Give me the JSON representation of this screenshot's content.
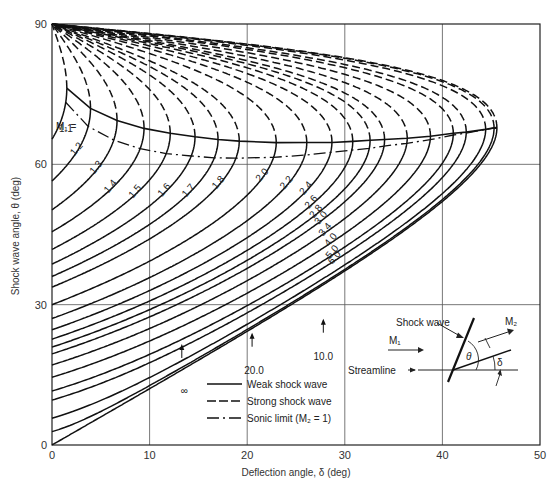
{
  "chart_data": {
    "type": "line",
    "title": "",
    "xlabel": "Deflection angle, δ (deg)",
    "ylabel": "Shock wave angle, θ (deg)",
    "xlim": [
      0,
      50
    ],
    "ylim": [
      0,
      90
    ],
    "x_ticks": [
      "0",
      "10",
      "20",
      "30",
      "40",
      "50"
    ],
    "y_ticks": [
      "0",
      "30",
      "60",
      "90"
    ],
    "grid": true,
    "gamma": 1.4,
    "mach_label_prefix": "M₁ =",
    "series": [
      {
        "name": "1.1",
        "mach": 1.1
      },
      {
        "name": "1.2",
        "mach": 1.2
      },
      {
        "name": "1.3",
        "mach": 1.3
      },
      {
        "name": "1.4",
        "mach": 1.4
      },
      {
        "name": "1.5",
        "mach": 1.5
      },
      {
        "name": "1.6",
        "mach": 1.6
      },
      {
        "name": "1.7",
        "mach": 1.7
      },
      {
        "name": "1.8",
        "mach": 1.8
      },
      {
        "name": "2.0",
        "mach": 2.0
      },
      {
        "name": "2.2",
        "mach": 2.2
      },
      {
        "name": "2.4",
        "mach": 2.4
      },
      {
        "name": "2.6",
        "mach": 2.6
      },
      {
        "name": "2.8",
        "mach": 2.8
      },
      {
        "name": "3.0",
        "mach": 3.0
      },
      {
        "name": "3.4",
        "mach": 3.4
      },
      {
        "name": "4.0",
        "mach": 4.0
      },
      {
        "name": "5.0",
        "mach": 5.0
      },
      {
        "name": "6.0",
        "mach": 6.0
      },
      {
        "name": "10.0",
        "mach": 10.0
      },
      {
        "name": "20.0",
        "mach": 20.0
      },
      {
        "name": "∞",
        "mach": 1000
      }
    ],
    "max_deflection_example": {
      "mach": "∞",
      "delta_max": 45.6,
      "theta_at_max": 67.8
    },
    "legend": [
      {
        "label": "Weak shock wave",
        "style": "solid"
      },
      {
        "label": "Strong shock wave",
        "style": "dashed"
      },
      {
        "label": "Sonic limit (M₂ = 1)",
        "style": "dashdot"
      }
    ]
  },
  "inset": {
    "shock_label": "Shock wave",
    "m1_label": "M₁",
    "m2_label": "M₂",
    "streamline_label": "Streamline",
    "theta_symbol": "θ",
    "delta_symbol": "δ"
  }
}
